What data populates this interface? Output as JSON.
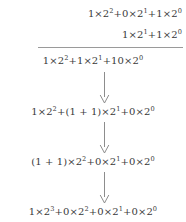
{
  "document": {
    "kind": "binary-addition-derivation",
    "background_color": "#ffffff",
    "text_color": "#3a3a3a",
    "rule_color": "#9a9a9a",
    "arrow_color": "#8d8d8d"
  },
  "addition": {
    "augend": {
      "text": "1 × 2² + 0 × 2¹ + 1 × 2⁰",
      "terms": [
        {
          "coefficient": "1",
          "times": "×",
          "base": "2",
          "exponent": "2"
        },
        {
          "coefficient": "0",
          "times": "×",
          "base": "2",
          "exponent": "1"
        },
        {
          "coefficient": "1",
          "times": "×",
          "base": "2",
          "exponent": "0"
        }
      ],
      "value_decimal": "5"
    },
    "addend": {
      "text": "1 × 2¹ + 1 × 2⁰",
      "terms": [
        {
          "coefficient": "1",
          "times": "×",
          "base": "2",
          "exponent": "1"
        },
        {
          "coefficient": "1",
          "times": "×",
          "base": "2",
          "exponent": "0"
        }
      ],
      "value_decimal": "3"
    },
    "rule_label": "addition-bar"
  },
  "steps": [
    {
      "id": "step-1-column-sum",
      "text": "1 × 2² + 1 × 2¹ + 10 × 2⁰",
      "terms": [
        {
          "coefficient": "1",
          "times": "×",
          "base": "2",
          "exponent": "2"
        },
        {
          "coefficient": "1",
          "times": "×",
          "base": "2",
          "exponent": "1"
        },
        {
          "coefficient": "10",
          "times": "×",
          "base": "2",
          "exponent": "0"
        }
      ]
    },
    {
      "id": "step-2-carry-from-units",
      "text": "1 × 2² + (1 + 1) × 2¹ + 0 × 2⁰",
      "terms": [
        {
          "coefficient": "1",
          "times": "×",
          "base": "2",
          "exponent": "2"
        },
        {
          "coefficient": "(1 + 1)",
          "times": "×",
          "base": "2",
          "exponent": "1"
        },
        {
          "coefficient": "0",
          "times": "×",
          "base": "2",
          "exponent": "0"
        }
      ]
    },
    {
      "id": "step-3-carry-from-twos",
      "text": "(1 + 1) × 2² + 0 × 2¹ + 0 × 2⁰",
      "terms": [
        {
          "coefficient": "(1 + 1)",
          "times": "×",
          "base": "2",
          "exponent": "2"
        },
        {
          "coefficient": "0",
          "times": "×",
          "base": "2",
          "exponent": "1"
        },
        {
          "coefficient": "0",
          "times": "×",
          "base": "2",
          "exponent": "0"
        }
      ]
    },
    {
      "id": "step-4-result",
      "text": "1 × 2³ + 0 × 2² + 0 × 2¹ + 0 × 2⁰",
      "terms": [
        {
          "coefficient": "1",
          "times": "×",
          "base": "2",
          "exponent": "3"
        },
        {
          "coefficient": "0",
          "times": "×",
          "base": "2",
          "exponent": "2"
        },
        {
          "coefficient": "0",
          "times": "×",
          "base": "2",
          "exponent": "1"
        },
        {
          "coefficient": "0",
          "times": "×",
          "base": "2",
          "exponent": "0"
        }
      ],
      "value_decimal": "8"
    }
  ],
  "arrows": [
    {
      "id": "arrow-1",
      "direction": "down"
    },
    {
      "id": "arrow-2",
      "direction": "down"
    },
    {
      "id": "arrow-3",
      "direction": "down"
    }
  ]
}
